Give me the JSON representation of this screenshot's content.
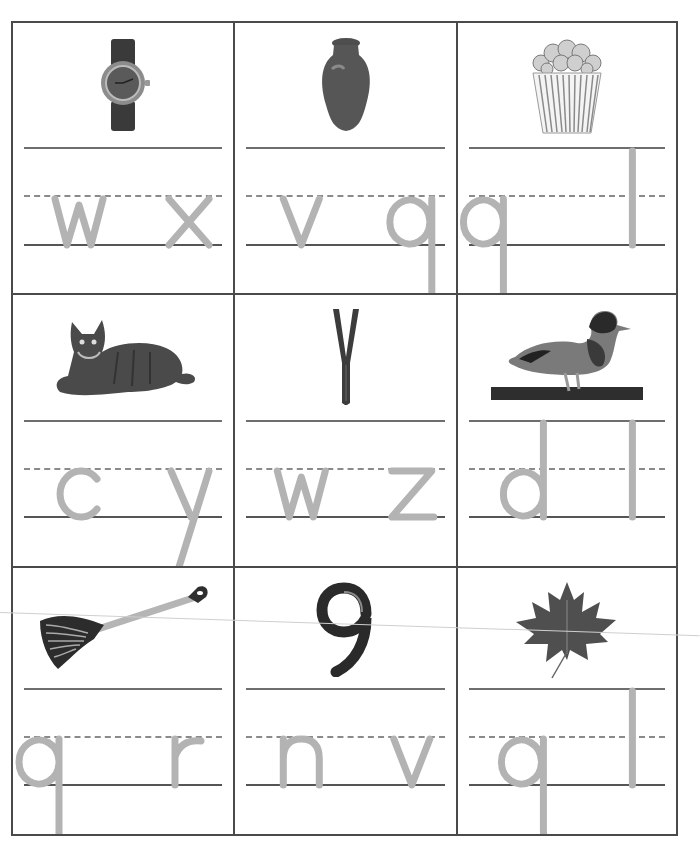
{
  "worksheet": {
    "colors": {
      "grid_line": "#4a4a4a",
      "rule_line": "#6e6e6e",
      "dashed_line": "#8a8a8a",
      "letter_trace": "#b3b3b3"
    },
    "cells": [
      {
        "picture": "watch",
        "picture_icon": "watch-icon",
        "choices": [
          "w",
          "x"
        ]
      },
      {
        "picture": "vase",
        "picture_icon": "vase-icon",
        "choices": [
          "v",
          "q"
        ]
      },
      {
        "picture": "popcorn",
        "picture_icon": "popcorn-icon",
        "choices": [
          "p",
          "l"
        ]
      },
      {
        "picture": "cat",
        "picture_icon": "cat-icon",
        "choices": [
          "c",
          "y"
        ]
      },
      {
        "picture": "zipper",
        "picture_icon": "zipper-icon",
        "choices": [
          "w",
          "z"
        ]
      },
      {
        "picture": "duck",
        "picture_icon": "duck-icon",
        "choices": [
          "d",
          "l"
        ]
      },
      {
        "picture": "rake",
        "picture_icon": "rake-icon",
        "choices": [
          "p",
          "r"
        ]
      },
      {
        "picture": "nine",
        "picture_icon": "number-nine-icon",
        "choices": [
          "n",
          "v"
        ]
      },
      {
        "picture": "leaf",
        "picture_icon": "leaf-icon",
        "choices": [
          "q",
          "l"
        ]
      }
    ]
  }
}
